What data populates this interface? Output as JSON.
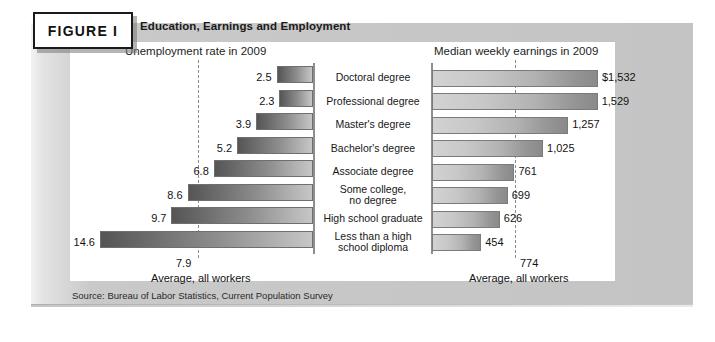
{
  "figure": {
    "tag_label": "FIGURE I",
    "title": "Education, Earnings and Employment",
    "source": "Source: Bureau of Labor Statistics, Current Population Survey"
  },
  "panels": {
    "left_heading": "Unemployment rate in 2009",
    "right_heading": "Median weekly earnings in 2009",
    "left_average_value": "7.9",
    "left_average_caption": "Average, all workers",
    "right_average_value": "774",
    "right_average_caption": "Average, all workers"
  },
  "rows": [
    {
      "category": "Doctoral degree",
      "unemployment_label": "2.5",
      "earnings_label": "$1,532"
    },
    {
      "category": "Professional degree",
      "unemployment_label": "2.3",
      "earnings_label": "1,529"
    },
    {
      "category": "Master's degree",
      "unemployment_label": "3.9",
      "earnings_label": "1,257"
    },
    {
      "category": "Bachelor's degree",
      "unemployment_label": "5.2",
      "earnings_label": "1,025"
    },
    {
      "category": "Associate degree",
      "unemployment_label": "6.8",
      "earnings_label": "761"
    },
    {
      "category": "Some college,\nno degree",
      "unemployment_label": "8.6",
      "earnings_label": "699"
    },
    {
      "category": "High school graduate",
      "unemployment_label": "9.7",
      "earnings_label": "626"
    },
    {
      "category": "Less than a high\nschool diploma",
      "unemployment_label": "14.6",
      "earnings_label": "454"
    }
  ],
  "chart_data": [
    {
      "type": "bar",
      "title": "Unemployment rate in 2009",
      "orientation": "horizontal",
      "direction": "right-to-left",
      "xlabel": "Unemployment rate (percent)",
      "ylabel": "",
      "categories": [
        "Doctoral degree",
        "Professional degree",
        "Master's degree",
        "Bachelor's degree",
        "Associate degree",
        "Some college, no degree",
        "High school graduate",
        "Less than a high school diploma"
      ],
      "values": [
        2.5,
        2.3,
        3.9,
        5.2,
        6.8,
        8.6,
        9.7,
        14.6
      ],
      "xlim": [
        0,
        14.6
      ],
      "grid": false,
      "legend": "none",
      "annotations": [
        {
          "text": "Average, all workers",
          "value": 7.9,
          "style": "dashed-reference-line"
        }
      ]
    },
    {
      "type": "bar",
      "title": "Median weekly earnings in 2009",
      "orientation": "horizontal",
      "direction": "left-to-right",
      "xlabel": "Median weekly earnings (US dollars)",
      "ylabel": "",
      "categories": [
        "Doctoral degree",
        "Professional degree",
        "Master's degree",
        "Bachelor's degree",
        "Associate degree",
        "Some college, no degree",
        "High school graduate",
        "Less than a high school diploma"
      ],
      "values": [
        1532,
        1529,
        1257,
        1025,
        761,
        699,
        626,
        454
      ],
      "xlim": [
        0,
        1532
      ],
      "grid": false,
      "legend": "none",
      "annotations": [
        {
          "text": "Average, all workers",
          "value": 774,
          "style": "dashed-reference-line"
        }
      ]
    }
  ],
  "colors": {
    "panel_background": "#c6c6c6",
    "plate_background": "#ffffff",
    "bar_dark": "#555555",
    "bar_light": "#d2d2d2",
    "axis": "#8e8e8e",
    "text": "#171717"
  }
}
